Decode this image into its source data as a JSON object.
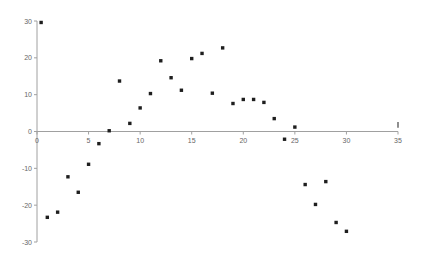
{
  "chart_data": {
    "type": "scatter",
    "title": "",
    "xlabel": "",
    "ylabel": "",
    "xlim": [
      0,
      35
    ],
    "ylim": [
      -30,
      30
    ],
    "x_ticks": [
      0,
      5,
      10,
      15,
      20,
      25,
      30,
      35
    ],
    "y_ticks": [
      -30,
      -20,
      -10,
      0,
      10,
      20,
      30
    ],
    "grid": false,
    "legend": null,
    "series": [
      {
        "name": "Series 1",
        "color": "#1e1e1e",
        "marker": "square",
        "points": [
          {
            "x": 0.4,
            "y": 29.6
          },
          {
            "x": 1,
            "y": -23.3
          },
          {
            "x": 2,
            "y": -21.9
          },
          {
            "x": 3,
            "y": -12.3
          },
          {
            "x": 4,
            "y": -16.5
          },
          {
            "x": 5,
            "y": -8.9
          },
          {
            "x": 6,
            "y": -3.3
          },
          {
            "x": 7,
            "y": 0.2
          },
          {
            "x": 8,
            "y": 13.7
          },
          {
            "x": 9,
            "y": 2.2
          },
          {
            "x": 10,
            "y": 6.4
          },
          {
            "x": 11,
            "y": 10.3
          },
          {
            "x": 12,
            "y": 19.2
          },
          {
            "x": 13,
            "y": 14.6
          },
          {
            "x": 14,
            "y": 11.2
          },
          {
            "x": 15,
            "y": 19.8
          },
          {
            "x": 16,
            "y": 21.2
          },
          {
            "x": 17,
            "y": 10.4
          },
          {
            "x": 18,
            "y": 22.7
          },
          {
            "x": 19,
            "y": 7.6
          },
          {
            "x": 20,
            "y": 8.7
          },
          {
            "x": 21,
            "y": 8.7
          },
          {
            "x": 22,
            "y": 7.9
          },
          {
            "x": 23,
            "y": 3.5
          },
          {
            "x": 24,
            "y": -2.1
          },
          {
            "x": 25,
            "y": 1.2
          },
          {
            "x": 26,
            "y": -14.4
          },
          {
            "x": 27,
            "y": -19.8
          },
          {
            "x": 28,
            "y": -13.6
          },
          {
            "x": 29,
            "y": -24.7
          },
          {
            "x": 30,
            "y": -27.1
          }
        ]
      }
    ],
    "annotations": [
      {
        "type": "vertical-mark",
        "x": 35,
        "y_from": 1.0,
        "y_to": 2.6
      }
    ]
  },
  "axes": {
    "x_tick_labels": [
      "0",
      "5",
      "10",
      "15",
      "20",
      "25",
      "30",
      "35"
    ],
    "y_tick_labels": [
      "30",
      "20",
      "10",
      "0",
      "-10",
      "-20",
      "-30"
    ]
  }
}
